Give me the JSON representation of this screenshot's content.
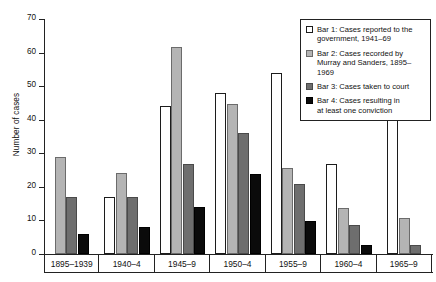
{
  "chart_data": {
    "type": "bar",
    "title": "",
    "subtitle": "",
    "xlabel": "",
    "ylabel": "Number of cases",
    "ylim": [
      0,
      70
    ],
    "yticks": [
      0,
      10,
      20,
      30,
      40,
      50,
      60,
      70
    ],
    "ytick_labels": [
      "0",
      "10",
      "20",
      "30",
      "40",
      "50",
      "60",
      "70"
    ],
    "grid": false,
    "legend_position": "top-right",
    "categories": [
      "1895–1939",
      "1940–4",
      "1945–9",
      "1950–4",
      "1955–9",
      "1960–4",
      "1965–9"
    ],
    "series": [
      {
        "name": "Bar 1: Cases reported to the government, 1941–69",
        "short_name": "Bar 1",
        "color": "#ffffff",
        "values": [
          null,
          17,
          44,
          48,
          54,
          26.7,
          42.6
        ]
      },
      {
        "name": "Bar 2: Cases recorded by Murray and Sanders, 1895–1969",
        "short_name": "Bar 2",
        "color": "#b4b4b4",
        "values": [
          29,
          24,
          61.8,
          44.8,
          25.7,
          13.7,
          10.7
        ]
      },
      {
        "name": "Bar 3: Cases taken to court",
        "short_name": "Bar 3",
        "color": "#6e6e6e",
        "values": [
          17,
          17,
          26.9,
          35.9,
          20.8,
          8.7,
          2.7
        ]
      },
      {
        "name": "Bar 4: Cases resulting in at least one conviction",
        "short_name": "Bar 4",
        "color": "#0b0b0b",
        "values": [
          6,
          8,
          13.9,
          23.8,
          9.7,
          2.7,
          null
        ]
      }
    ],
    "annotations": []
  },
  "legend": {
    "items": [
      {
        "swatch": "s1",
        "label": "Bar 1: Cases reported to the\ngovernment, 1941–69"
      },
      {
        "swatch": "s2",
        "label": "Bar 2: Cases recorded by\nMurray and Sanders, 1895–1969"
      },
      {
        "swatch": "s3",
        "label": "Bar 3: Cases taken to court"
      },
      {
        "swatch": "s4",
        "label": "Bar 4: Cases resulting in\nat least one conviction"
      }
    ]
  },
  "axes": {
    "y_title": "Number of cases"
  },
  "colors": {
    "series1": "#ffffff",
    "series2": "#b4b4b4",
    "series3": "#6e6e6e",
    "series4": "#0b0b0b",
    "axis": "#222222",
    "background": "#ffffff"
  }
}
